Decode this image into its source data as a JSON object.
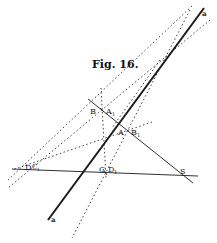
{
  "figure": {
    "title": "Fig. 16.",
    "ink_color": "#1a1a1a",
    "background": "#ffffff"
  },
  "labels": {
    "a_top": "a",
    "a_bottom": "a",
    "B": "B",
    "A1": "A",
    "A1_sub": "1",
    "A": "A",
    "B1": "B",
    "B1_sub": "1",
    "D": "D",
    "C1": "C",
    "C1_sub": "1",
    "C": "C",
    "D1": "D",
    "D1_sub": "1",
    "S": "S"
  },
  "lines": {
    "solid": [
      {
        "name": "line-a",
        "from": [
          204,
          8
        ],
        "to": [
          48,
          220
        ],
        "weight": "thick"
      },
      {
        "name": "line-bs",
        "from": [
          88,
          99
        ],
        "to": [
          193,
          183
        ],
        "weight": "thin"
      },
      {
        "name": "line-ds",
        "from": [
          12,
          169
        ],
        "to": [
          198,
          176
        ],
        "weight": "thin"
      }
    ],
    "dotted": [
      {
        "name": "dotted-1",
        "from": [
          192,
          6
        ],
        "to": [
          8,
          178
        ]
      },
      {
        "name": "dotted-2",
        "from": [
          210,
          20
        ],
        "to": [
          8,
          188
        ]
      },
      {
        "name": "dotted-3",
        "from": [
          188,
          12
        ],
        "to": [
          72,
          240
        ]
      },
      {
        "name": "dotted-4",
        "from": [
          152,
          22
        ],
        "to": [
          112,
          126
        ]
      },
      {
        "name": "dotted-5",
        "from": [
          101,
          88
        ],
        "to": [
          106,
          178
        ]
      },
      {
        "name": "dotted-6",
        "from": [
          150,
          122
        ],
        "to": [
          14,
          172
        ]
      }
    ]
  }
}
